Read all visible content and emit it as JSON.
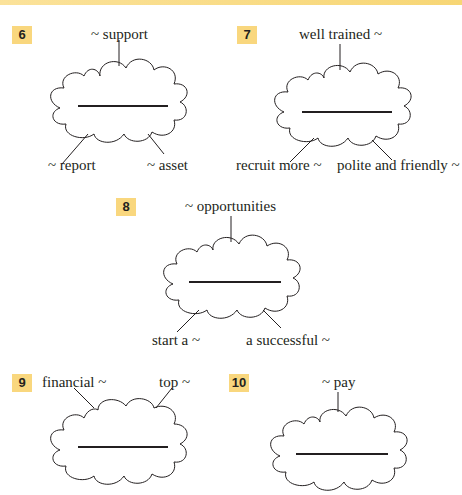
{
  "header": {
    "band_color": "#f7d675"
  },
  "exercises": [
    {
      "number": "6",
      "top": "~ support",
      "left_bottom": "~ report",
      "right_bottom": "~ asset"
    },
    {
      "number": "7",
      "top": "well trained ~",
      "left_bottom": "recruit more ~",
      "right_bottom": "polite and friendly ~"
    },
    {
      "number": "8",
      "top": "~ opportunities",
      "left_bottom": "start a ~",
      "right_bottom": "a successful ~"
    },
    {
      "number": "9",
      "top_left": "financial ~",
      "top_right": "top ~"
    },
    {
      "number": "10",
      "top": "~ pay"
    }
  ],
  "colors": {
    "number_box": "#f9d77e",
    "text": "#231f20"
  }
}
